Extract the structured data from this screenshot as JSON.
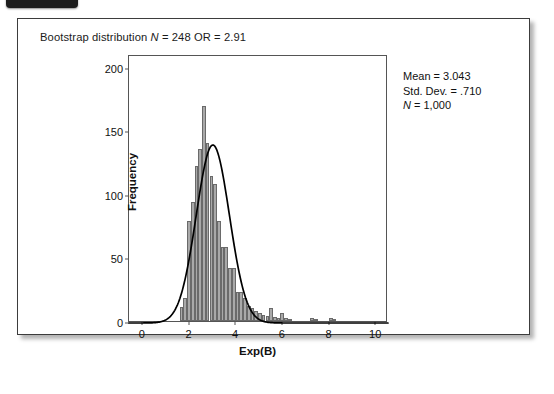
{
  "badge": {
    "name": "corner-badge",
    "color": "#1c1c1c"
  },
  "card": {
    "border_color": "#3c3c3c",
    "background": "#ffffff"
  },
  "title": {
    "prefix": "Bootstrap distribution ",
    "n_symbol": "N",
    "middle": " = 248 OR = 2.91",
    "full": "Bootstrap distribution N = 248 OR = 2.91"
  },
  "annotation": {
    "mean_label": "Mean = 3.043",
    "sd_label": "Std. Dev. = .710",
    "n_symbol": "N",
    "n_value": " = 1,000"
  },
  "chart_data": {
    "type": "bar",
    "title": "Bootstrap distribution N = 248 OR = 2.91",
    "subtitle": "",
    "xlabel": "Exp(B)",
    "ylabel": "Frequency",
    "xlim": [
      -0.55,
      10.55
    ],
    "ylim": [
      0,
      210
    ],
    "grid": false,
    "legend": "none",
    "bar_color": "#a9a9a9",
    "bar_edge_color": "#6a6a6a",
    "curve_color": "#000000",
    "xticks": [
      0,
      2,
      4,
      6,
      8,
      10
    ],
    "xtick_labels": [
      "0",
      "2",
      "4",
      "6",
      "8",
      "10"
    ],
    "yticks": [
      0,
      50,
      100,
      150,
      200
    ],
    "ytick_labels": [
      "0",
      "50",
      "100",
      "150",
      "200"
    ],
    "bin_width": 0.16,
    "annotations": [
      "Mean = 3.043",
      "Std. Dev. = .710",
      "N = 1,000"
    ],
    "statistics": {
      "mean": 3.043,
      "std_dev": 0.71,
      "n": 1000
    },
    "normal_curve": {
      "mean": 3.043,
      "std_dev": 0.71,
      "peak_frequency": 140
    },
    "x": [
      1.7,
      1.86,
      2.02,
      2.18,
      2.34,
      2.5,
      2.66,
      2.82,
      2.98,
      3.14,
      3.3,
      3.46,
      3.62,
      3.78,
      3.94,
      4.1,
      4.26,
      4.42,
      4.58,
      4.74,
      4.9,
      5.06,
      5.22,
      5.38,
      5.54,
      5.7,
      5.86,
      6.02,
      6.18,
      6.34,
      7.3,
      7.46,
      8.1,
      8.26
    ],
    "values": [
      11,
      18,
      79,
      94,
      122,
      135,
      169,
      140,
      114,
      108,
      79,
      58,
      58,
      42,
      42,
      23,
      23,
      18,
      12,
      10,
      8,
      6,
      5,
      4,
      10,
      3,
      2,
      6,
      2,
      1,
      2,
      1,
      2,
      1
    ]
  }
}
